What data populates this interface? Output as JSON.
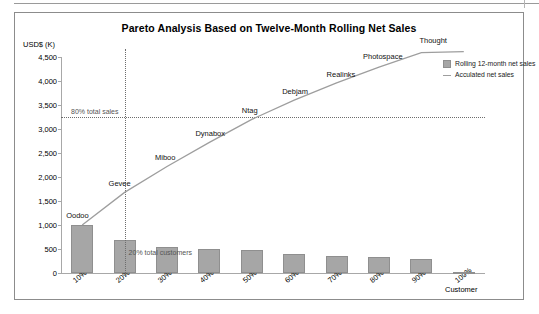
{
  "chart": {
    "title": "Pareto Analysis Based on Twelve-Month Rolling Net Sales",
    "y_axis_title": "USD$ (K)",
    "x_axis_title": "Customer",
    "annotation_80": "80% total sales",
    "annotation_20": "20% total customers"
  },
  "legend": {
    "items": [
      {
        "label": "Rolling 12-month net sales",
        "color": "#a6a6a6",
        "marker": "swatch"
      },
      {
        "label": "Acculated net sales",
        "color": "#9e9e9e",
        "marker": "line"
      }
    ]
  },
  "chart_data": {
    "type": "bar",
    "title": "Pareto Analysis Based on Twelve-Month Rolling Net Sales",
    "xlabel": "Customer",
    "ylabel": "USD$ (K)",
    "ylim": [
      0,
      4500
    ],
    "ytick_labels": [
      "4,500",
      "4,000",
      "3,500",
      "3,000",
      "2,500",
      "2,000",
      "1,500",
      "1,000",
      "500",
      "0"
    ],
    "ytick_values": [
      4500,
      4000,
      3500,
      3000,
      2500,
      2000,
      1500,
      1000,
      500,
      0
    ],
    "categories": [
      "10%",
      "20%",
      "30%",
      "40%",
      "50%",
      "60%",
      "70%",
      "80%",
      "90%",
      "100%"
    ],
    "grid": false,
    "legend_position": "top-right",
    "series": [
      {
        "name": "Rolling 12-month net sales",
        "type": "bar",
        "color": "#a6a6a6",
        "values": [
          1000,
          680,
          540,
          500,
          480,
          400,
          360,
          330,
          300,
          20
        ]
      },
      {
        "name": "Acculated net sales",
        "type": "line",
        "color": "#9e9e9e",
        "values": [
          1000,
          1680,
          2220,
          2720,
          3200,
          3600,
          3960,
          4290,
          4590,
          4610
        ],
        "point_labels": [
          "Oodoo",
          "Gevee",
          "Miboo",
          "Dynabox",
          "Ntag",
          "Debjam",
          "Realinks",
          "Photospace",
          "Thought",
          ""
        ]
      }
    ],
    "reference_lines": [
      {
        "orientation": "horizontal",
        "value": 3250,
        "label": "80% total sales",
        "style": "dotted"
      },
      {
        "orientation": "vertical",
        "category": "20%",
        "label": "20% total customers",
        "style": "dotted"
      }
    ]
  }
}
